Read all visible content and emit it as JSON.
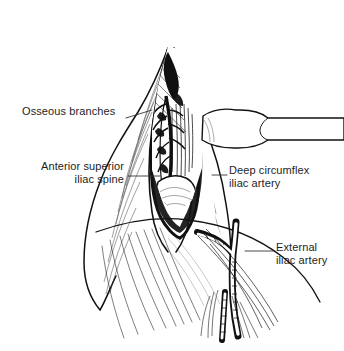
{
  "figure": {
    "background_color": "#ffffff",
    "ink_color": "#111111",
    "label_color": "#1d1d1d"
  },
  "labels": [
    {
      "id": "osseous-branches",
      "text": "Osseous branches",
      "align": "left",
      "leader": {
        "from_x": 126,
        "from_y": 118,
        "to_x": 152,
        "to_y": 110
      }
    },
    {
      "id": "anterior-superior-iliac-spine",
      "text": "Anterior superior\niliac spine",
      "align": "right",
      "leader": {
        "from_x": 128,
        "from_y": 176,
        "to_x": 160,
        "to_y": 176
      }
    },
    {
      "id": "deep-circumflex-iliac-artery",
      "text": "Deep circumflex\niliac artery",
      "align": "left",
      "leader": {
        "from_x": 214,
        "from_y": 175,
        "to_x": 227,
        "to_y": 175
      }
    },
    {
      "id": "external-iliac-artery",
      "text": "External\niliac artery",
      "align": "left",
      "leader": {
        "from_x": 247,
        "from_y": 251,
        "to_x": 274,
        "to_y": 251
      }
    }
  ],
  "illustration": {
    "type": "line-drawing",
    "medium": "pen-and-ink medical illustration",
    "structures": [
      {
        "name": "skin-flap-left",
        "description": "retracted skin and subcutaneous flap on the left of the incision with fine hatched shading"
      },
      {
        "name": "skin-flap-right",
        "description": "retracted skin and subcutaneous flap on the right of the incision"
      },
      {
        "name": "incision-cavity",
        "description": "vertical elliptical surgical wound opened between the flaps showing deep tissue"
      },
      {
        "name": "iliac-crest-bone",
        "description": "exposed bone of the anterior superior iliac spine at the base of the wound"
      },
      {
        "name": "muscle-fibers",
        "description": "striated muscle bellies shown with parallel hatching inside the wound"
      },
      {
        "name": "osseous-branches-vessels",
        "description": "small branching vessels entering bone at the upper wound"
      },
      {
        "name": "deep-circumflex-iliac-artery-vessel",
        "description": "artery coursing along the inner lip of the iliac crest"
      },
      {
        "name": "external-iliac-artery-vessel",
        "description": "larger vessel bifurcating in the lower right field"
      },
      {
        "name": "retractor-blade",
        "description": "surgical retractor blade entering from the right edge holding tissue aside"
      },
      {
        "name": "fascia-sheets",
        "description": "fan-shaped fascial fibers sweeping down to the lower edge of the field"
      }
    ]
  }
}
